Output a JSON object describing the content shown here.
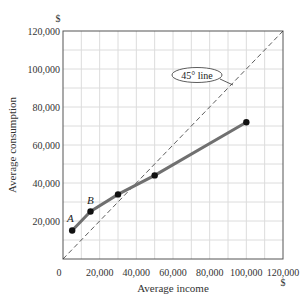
{
  "chart_data": {
    "type": "line",
    "title": "",
    "xlabel": "Average income",
    "ylabel": "Average consumption",
    "x_unit": "$",
    "y_unit": "$",
    "xlim": [
      0,
      120000
    ],
    "ylim": [
      0,
      120000
    ],
    "x_ticks": [
      "0",
      "20,000",
      "40,000",
      "60,000",
      "80,000",
      "100,000",
      "120,000"
    ],
    "y_ticks": [
      "20,000",
      "40,000",
      "60,000",
      "80,000",
      "100,000",
      "120,000"
    ],
    "grid": true,
    "grid_step": 10000,
    "series": [
      {
        "name": "Consumption function",
        "x": [
          5000,
          15000,
          30000,
          50000,
          100000
        ],
        "y": [
          15000,
          25000,
          34000,
          44000,
          72000
        ],
        "point_labels": [
          "A",
          "B",
          "",
          "",
          ""
        ],
        "color": "#707070"
      },
      {
        "name": "45° line",
        "x": [
          0,
          120000
        ],
        "y": [
          0,
          120000
        ],
        "style": "dashed",
        "color": "#333333"
      }
    ],
    "annotations": [
      {
        "text": "45° line",
        "target": "45-degree-line"
      },
      {
        "text": "A",
        "target": "point-1"
      },
      {
        "text": "B",
        "target": "point-2"
      }
    ]
  },
  "labels": {
    "y_unit": "$",
    "x_unit": "$",
    "xlabel": "Average income",
    "ylabel": "Average consumption",
    "callout": "45° line",
    "point_a": "A",
    "point_b": "B"
  }
}
